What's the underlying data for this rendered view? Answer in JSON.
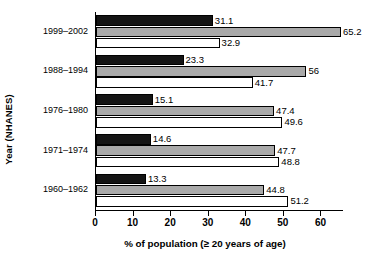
{
  "chart_data": {
    "type": "bar",
    "orientation": "horizontal",
    "title": "",
    "xlabel": "% of population (≥ 20 years of age)",
    "ylabel": "Year (NHANES)",
    "categories": [
      "1999–2002",
      "1988–1994",
      "1976–1980",
      "1971–1974",
      "1960–1962"
    ],
    "series": [
      {
        "name": "series-1-black",
        "color": "#141414",
        "values": [
          31.1,
          23.3,
          15.1,
          14.6,
          13.3
        ],
        "labels": [
          "31.1",
          "23.3",
          "15.1",
          "14.6",
          "13.3"
        ]
      },
      {
        "name": "series-2-gray",
        "color": "#a9a9a9",
        "values": [
          65.2,
          56,
          47.4,
          47.7,
          44.8
        ],
        "labels": [
          "65.2",
          "56",
          "47.4",
          "47.7",
          "44.8"
        ]
      },
      {
        "name": "series-3-white",
        "color": "#ffffff",
        "values": [
          32.9,
          41.7,
          49.6,
          48.8,
          51.2
        ],
        "labels": [
          "32.9",
          "41.7",
          "49.6",
          "48.8",
          "51.2"
        ]
      }
    ],
    "xlim": [
      0,
      66
    ],
    "xticks": [
      0,
      10,
      20,
      30,
      40,
      50,
      60
    ],
    "xtick_labels": [
      "0",
      "10",
      "20",
      "30",
      "40",
      "50",
      "60"
    ],
    "grid": false,
    "legend": "none"
  },
  "axes": {
    "x_title": "% of population (≥ 20 years of age)",
    "y_title": "Year (NHANES)"
  }
}
